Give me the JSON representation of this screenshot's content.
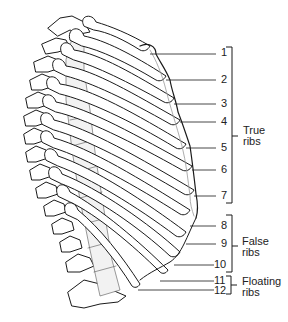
{
  "diagram": {
    "rib_labels": [
      "1",
      "2",
      "3",
      "4",
      "5",
      "6",
      "7",
      "8",
      "9",
      "10",
      "11",
      "12"
    ],
    "groups": [
      {
        "id": "true",
        "line1": "True",
        "line2": "ribs",
        "ribs": [
          "1",
          "2",
          "3",
          "4",
          "5",
          "6",
          "7"
        ]
      },
      {
        "id": "false",
        "line1": "False",
        "line2": "ribs",
        "ribs": [
          "8",
          "9",
          "10"
        ]
      },
      {
        "id": "floating",
        "line1": "Floating",
        "line2": "ribs",
        "ribs": [
          "11",
          "12"
        ]
      }
    ],
    "colors": {
      "line": "#1a1a1a",
      "background": "#ffffff",
      "shade": "#d8d8d8"
    }
  }
}
